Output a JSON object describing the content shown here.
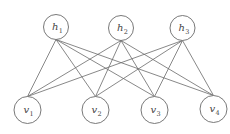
{
  "diagram": {
    "type": "bipartite-graph",
    "colors": {
      "stroke": "#6a6a6a",
      "text": "#444444",
      "background": "#ffffff"
    },
    "hidden_layer": {
      "nodes": [
        {
          "id": "h1",
          "base": "h",
          "sub": "1",
          "cx": 56,
          "cy": 27,
          "r": 12.5
        },
        {
          "id": "h2",
          "base": "h",
          "sub": "2",
          "cx": 121,
          "cy": 28,
          "r": 12.5
        },
        {
          "id": "h3",
          "base": "h",
          "sub": "3",
          "cx": 182.5,
          "cy": 28,
          "r": 12.5
        }
      ]
    },
    "visible_layer": {
      "nodes": [
        {
          "id": "v1",
          "base": "v",
          "sub": "1",
          "cx": 27.5,
          "cy": 110,
          "r": 13.5
        },
        {
          "id": "v2",
          "base": "v",
          "sub": "2",
          "cx": 95.5,
          "cy": 110,
          "r": 13.5
        },
        {
          "id": "v3",
          "base": "v",
          "sub": "3",
          "cx": 154.5,
          "cy": 110,
          "r": 13.5
        },
        {
          "id": "v4",
          "base": "v",
          "sub": "4",
          "cx": 213.5,
          "cy": 109,
          "r": 13.5
        }
      ]
    },
    "edges": [
      [
        "h1",
        "v1"
      ],
      [
        "h1",
        "v2"
      ],
      [
        "h1",
        "v3"
      ],
      [
        "h1",
        "v4"
      ],
      [
        "h2",
        "v1"
      ],
      [
        "h2",
        "v2"
      ],
      [
        "h2",
        "v3"
      ],
      [
        "h2",
        "v4"
      ],
      [
        "h3",
        "v1"
      ],
      [
        "h3",
        "v2"
      ],
      [
        "h3",
        "v3"
      ],
      [
        "h3",
        "v4"
      ]
    ]
  }
}
